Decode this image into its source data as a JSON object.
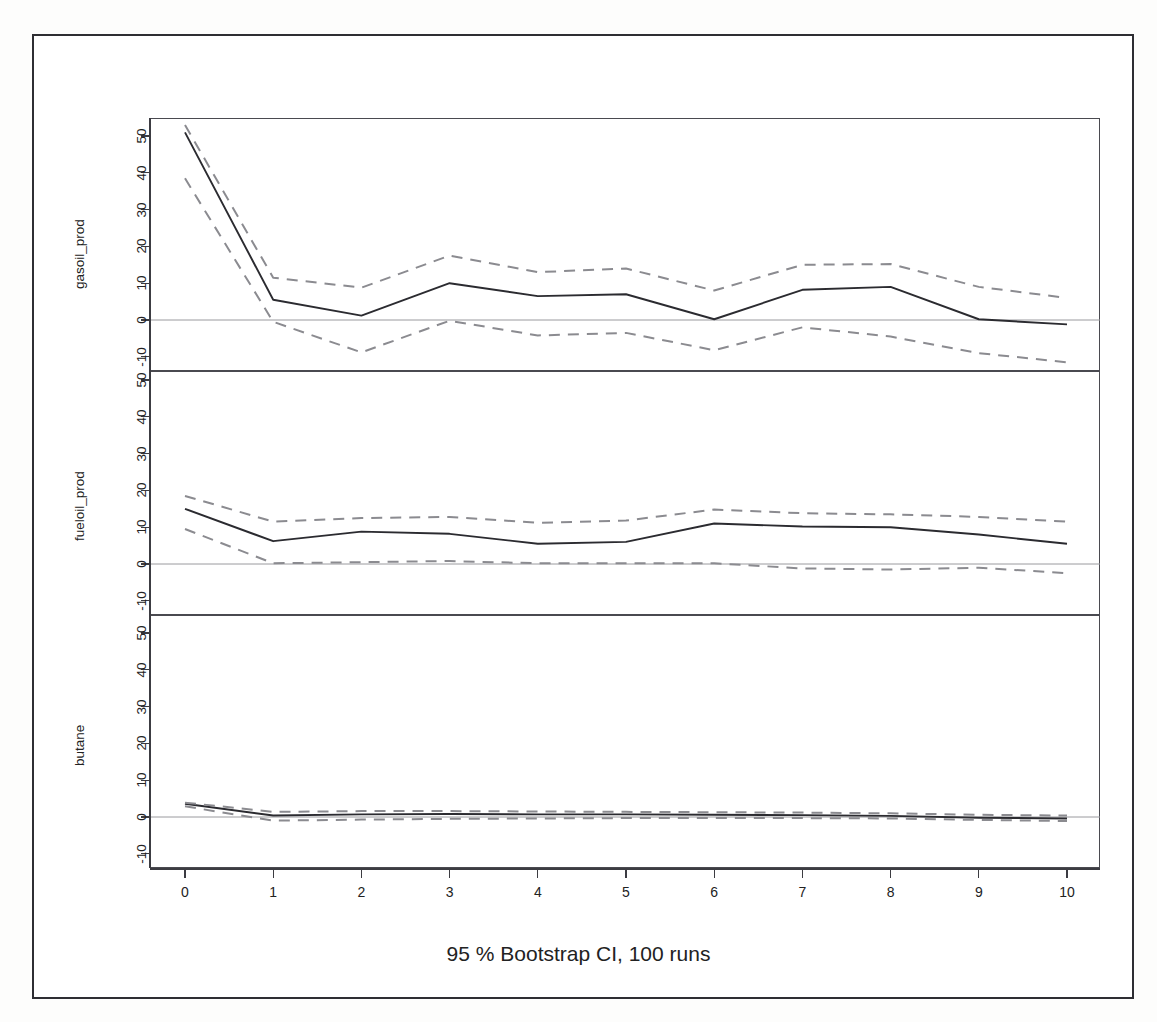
{
  "figure": {
    "title": "Orthogonal Impulse Response from oil_processed",
    "caption": "95 % Bootstrap CI,  100 runs",
    "background": "#ffffff",
    "solid_color": "#2b2b30",
    "ci_color": "#8b8b90",
    "zero_line_color": "#9a9a9e"
  },
  "axis": {
    "x_ticks": [
      "0",
      "1",
      "2",
      "3",
      "4",
      "5",
      "6",
      "7",
      "8",
      "9",
      "10"
    ],
    "y_ticks": [
      "-10",
      "0",
      "10",
      "20",
      "30",
      "40",
      "50"
    ],
    "panel_labels": [
      "gasoil_prod",
      "fueloil_prod",
      "butane"
    ]
  },
  "chart_data": {
    "type": "line",
    "title": "Orthogonal Impulse Response from oil_processed",
    "subtitle": "95 % Bootstrap CI,  100 runs",
    "xlabel": "",
    "ylabel": "",
    "xlim": [
      0,
      10
    ],
    "ylim": [
      -14,
      55
    ],
    "grid": false,
    "legend": "none",
    "x": [
      0,
      1,
      2,
      3,
      4,
      5,
      6,
      7,
      8,
      9,
      10
    ],
    "panels": [
      {
        "name": "gasoil_prod",
        "ylabel": "gasoil_prod",
        "ylim": [
          -14,
          55
        ],
        "yticks": [
          -10,
          0,
          10,
          20,
          30,
          40,
          50
        ],
        "series": [
          {
            "name": "impulse response",
            "style": "solid",
            "values": [
              51.0,
              5.5,
              1.2,
              10.0,
              6.5,
              7.0,
              0.2,
              8.2,
              9.0,
              0.2,
              -1.2
            ]
          },
          {
            "name": "upper 95% bootstrap CI",
            "style": "dashed",
            "values": [
              53.0,
              11.5,
              8.8,
              17.5,
              13.0,
              14.0,
              8.0,
              15.0,
              15.2,
              9.0,
              6.0
            ]
          },
          {
            "name": "lower 95% bootstrap CI",
            "style": "dashed",
            "values": [
              38.5,
              -0.5,
              -8.8,
              -0.2,
              -4.2,
              -3.5,
              -8.2,
              -2.0,
              -4.5,
              -9.0,
              -11.5
            ]
          }
        ]
      },
      {
        "name": "fueloil_prod",
        "ylabel": "fueloil_prod",
        "ylim": [
          -14,
          55
        ],
        "yticks": [
          -10,
          0,
          10,
          20,
          30,
          40,
          50
        ],
        "series": [
          {
            "name": "impulse response",
            "style": "solid",
            "values": [
              15.0,
              6.2,
              8.8,
              8.2,
              5.5,
              6.0,
              11.0,
              10.2,
              10.0,
              8.0,
              5.5
            ]
          },
          {
            "name": "upper 95% bootstrap CI",
            "style": "dashed",
            "values": [
              18.5,
              11.5,
              12.5,
              12.8,
              11.2,
              11.8,
              14.8,
              13.8,
              13.5,
              12.8,
              11.5
            ]
          },
          {
            "name": "lower 95% bootstrap CI",
            "style": "dashed",
            "values": [
              9.5,
              0.2,
              0.5,
              0.8,
              0.2,
              0.2,
              0.2,
              -1.2,
              -1.5,
              -1.0,
              -2.5
            ]
          }
        ]
      },
      {
        "name": "butane",
        "ylabel": "butane",
        "ylim": [
          -14,
          55
        ],
        "yticks": [
          -10,
          0,
          10,
          20,
          30,
          40,
          50
        ],
        "series": [
          {
            "name": "impulse response",
            "style": "solid",
            "values": [
              3.6,
              0.4,
              0.7,
              0.8,
              0.7,
              0.7,
              0.6,
              0.5,
              0.3,
              -0.2,
              -0.4
            ]
          },
          {
            "name": "upper 95% bootstrap CI",
            "style": "dashed",
            "values": [
              3.9,
              1.4,
              1.6,
              1.6,
              1.5,
              1.4,
              1.3,
              1.2,
              1.0,
              0.6,
              0.4
            ]
          },
          {
            "name": "lower 95% bootstrap CI",
            "style": "dashed",
            "values": [
              2.9,
              -1.0,
              -0.7,
              -0.5,
              -0.4,
              -0.3,
              -0.3,
              -0.3,
              -0.4,
              -0.8,
              -1.1
            ]
          }
        ]
      }
    ]
  }
}
